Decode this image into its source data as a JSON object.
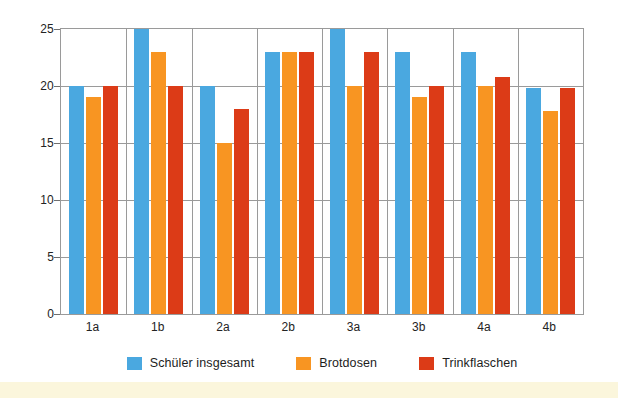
{
  "chart_data": {
    "type": "bar",
    "title": "",
    "xlabel": "",
    "ylabel": "",
    "ylim": [
      0,
      25
    ],
    "yticks": [
      0,
      5,
      10,
      15,
      20,
      25
    ],
    "grid": true,
    "legend_position": "bottom-center",
    "categories": [
      "1a",
      "1b",
      "2a",
      "2b",
      "3a",
      "3b",
      "4a",
      "4b"
    ],
    "series": [
      {
        "name": "Schüler insgesamt",
        "color": "#4aa8e0",
        "values": [
          20,
          25,
          20,
          23,
          25,
          23,
          23,
          19.8
        ]
      },
      {
        "name": "Brotdosen",
        "color": "#f89522",
        "values": [
          19,
          23,
          15,
          23,
          20,
          19,
          20,
          17.8
        ]
      },
      {
        "name": "Trinkflaschen",
        "color": "#dc3b17",
        "values": [
          20,
          20,
          18,
          23,
          23,
          20,
          20.8,
          19.8
        ]
      }
    ]
  },
  "axis": {
    "y_tick_labels": [
      "25",
      "20",
      "15",
      "10",
      "5",
      "0"
    ]
  },
  "legend": {
    "items": [
      {
        "label": "Schüler insgesamt",
        "swatch": "legend-swatch-blue"
      },
      {
        "label": "Brotdosen",
        "swatch": "legend-swatch-orange"
      },
      {
        "label": "Trinkflaschen",
        "swatch": "legend-swatch-red"
      }
    ]
  }
}
